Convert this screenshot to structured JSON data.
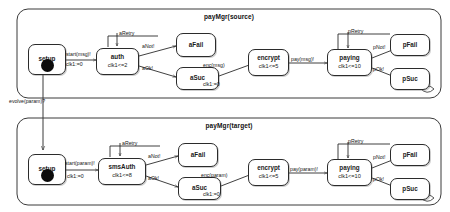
{
  "diagram": {
    "type": "uml-statechart-pair",
    "caption_top": "payMgr(source)",
    "caption_bottom": "payMgr(target)",
    "evolution_label": "evolve(param)?"
  },
  "regions": [
    {
      "id": "source",
      "title": "payMgr(source)",
      "states": [
        {
          "id": "setup",
          "name": "setup",
          "invariant": "",
          "initial": true
        },
        {
          "id": "auth",
          "name": "auth",
          "invariant": "clk1<=2",
          "initial": false
        },
        {
          "id": "aFail",
          "name": "aFail",
          "invariant": "",
          "initial": false
        },
        {
          "id": "aSuc",
          "name": "aSuc",
          "invariant": "",
          "initial": false
        },
        {
          "id": "encrypt",
          "name": "encrypt",
          "invariant": "clk1<=5",
          "initial": false
        },
        {
          "id": "paying",
          "name": "paying",
          "invariant": "clk1<=10",
          "initial": false
        },
        {
          "id": "pFail",
          "name": "pFail",
          "invariant": "",
          "initial": false
        },
        {
          "id": "pSuc",
          "name": "pSuc",
          "invariant": "",
          "initial": false
        }
      ],
      "transitions": [
        {
          "from": "setup",
          "to": "auth",
          "event": "start(msg)!",
          "action": "clk1:=0"
        },
        {
          "from": "auth",
          "to": "auth",
          "event": "aRetry",
          "action": ""
        },
        {
          "from": "auth",
          "to": "aFail",
          "event": "aNot!",
          "action": ""
        },
        {
          "from": "auth",
          "to": "aSuc",
          "event": "aOk!",
          "action": ""
        },
        {
          "from": "aSuc",
          "to": "encrypt",
          "event": "enc(msg)",
          "action": "clk1:=0"
        },
        {
          "from": "encrypt",
          "to": "paying",
          "event": "pay(msg)!",
          "action": ""
        },
        {
          "from": "paying",
          "to": "paying",
          "event": "pRetry",
          "action": ""
        },
        {
          "from": "paying",
          "to": "pFail",
          "event": "pNot!",
          "action": ""
        },
        {
          "from": "paying",
          "to": "pSuc",
          "event": "pOk!",
          "action": ""
        }
      ]
    },
    {
      "id": "target",
      "title": "payMgr(target)",
      "states": [
        {
          "id": "setup",
          "name": "setup",
          "invariant": "",
          "initial": true
        },
        {
          "id": "smsAuth",
          "name": "smsAuth",
          "invariant": "clk1<=8",
          "initial": false
        },
        {
          "id": "aFail",
          "name": "aFail",
          "invariant": "",
          "initial": false
        },
        {
          "id": "aSuc",
          "name": "aSuc",
          "invariant": "",
          "initial": false
        },
        {
          "id": "encrypt",
          "name": "encrypt",
          "invariant": "clk1<=5",
          "initial": false
        },
        {
          "id": "paying",
          "name": "paying",
          "invariant": "clk1<=10",
          "initial": false
        },
        {
          "id": "pFail",
          "name": "pFail",
          "invariant": "",
          "initial": false
        },
        {
          "id": "pSuc",
          "name": "pSuc",
          "invariant": "",
          "initial": false
        }
      ],
      "transitions": [
        {
          "from": "setup",
          "to": "smsAuth",
          "event": "start(param)!",
          "action": "clk1:=0"
        },
        {
          "from": "smsAuth",
          "to": "smsAuth",
          "event": "aRetry",
          "action": ""
        },
        {
          "from": "smsAuth",
          "to": "aFail",
          "event": "aNot!",
          "action": ""
        },
        {
          "from": "smsAuth",
          "to": "aSuc",
          "event": "aOk!",
          "action": ""
        },
        {
          "from": "aSuc",
          "to": "encrypt",
          "event": "enc(param)",
          "action": "clk1:=0"
        },
        {
          "from": "encrypt",
          "to": "paying",
          "event": "pay(param)!",
          "action": ""
        },
        {
          "from": "paying",
          "to": "paying",
          "event": "pRetry",
          "action": ""
        },
        {
          "from": "paying",
          "to": "pFail",
          "event": "pNot!",
          "action": ""
        },
        {
          "from": "paying",
          "to": "pSuc",
          "event": "pOk!",
          "action": ""
        }
      ]
    }
  ],
  "labels": {
    "top": {
      "setup": "setup",
      "auth": "auth",
      "auth_inv": "clk1<=2",
      "aFail": "aFail",
      "aSuc": "aSuc",
      "encrypt": "encrypt",
      "encrypt_inv": "clk1<=5",
      "paying": "paying",
      "paying_inv": "clk1<=10",
      "pFail": "pFail",
      "pSuc": "pSuc",
      "t_start": "start(msg)!",
      "t_start_act": "clk1:=0",
      "t_aretry": "aRetry",
      "t_anot": "aNot!",
      "t_aok": "aOk!",
      "t_enc": "enc(msg)",
      "t_enc_act": "clk1:=0",
      "t_pay": "pay(msg)!",
      "t_pretry": "pRetry",
      "t_pnot": "pNot!",
      "t_pok": "pOk!"
    },
    "bottom": {
      "setup": "setup",
      "smsAuth": "smsAuth",
      "smsAuth_inv": "clk1<=8",
      "aFail": "aFail",
      "aSuc": "aSuc",
      "encrypt": "encrypt",
      "encrypt_inv": "clk1<=5",
      "paying": "paying",
      "paying_inv": "clk1<=10",
      "pFail": "pFail",
      "pSuc": "pSuc",
      "t_start": "start(param)!",
      "t_start_act": "clk1:=0",
      "t_aretry": "aRetry",
      "t_anot": "aNot!",
      "t_aok": "aOk!",
      "t_enc": "enc(param)",
      "t_enc_act": "clk1:=0",
      "t_pay": "pay(param)!",
      "t_pretry": "pRetry",
      "t_pnot": "pNot!",
      "t_pok": "pOk!"
    }
  },
  "colors": {
    "stroke": "#2b2b2b",
    "fill": "#ffffff",
    "initial_dot": "#0b0b0b",
    "background": "#ffffff"
  }
}
